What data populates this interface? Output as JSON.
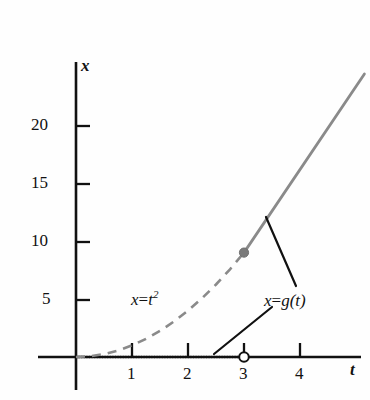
{
  "figure": {
    "title": "",
    "background_color": "#fefefe",
    "ink_color": "#111111",
    "curve_color": "#8a8a8a"
  },
  "axes": {
    "x_axis_name": "t",
    "y_axis_name": "x",
    "x_ticks": [
      "1",
      "2",
      "3",
      "4"
    ],
    "y_ticks": [
      "5",
      "10",
      "15",
      "20"
    ]
  },
  "labels": {
    "parabola": {
      "lhs": "x",
      "op": "=",
      "base": "t",
      "exponent": "2"
    },
    "piecewise": {
      "lhs": "x",
      "op": "=",
      "rhs": "g(t)"
    }
  },
  "markers": {
    "closed_point_label": "(3, 9)",
    "open_point_label": "(3, 0)"
  },
  "chart_data": {
    "type": "line",
    "title": "",
    "xlabel": "t",
    "ylabel": "x",
    "xlim": [
      -0.45,
      5.2
    ],
    "ylim": [
      -1.2,
      25.5
    ],
    "grid": false,
    "legend": "none",
    "x_ticks": [
      1,
      2,
      3,
      4
    ],
    "y_ticks": [
      5,
      10,
      15,
      20
    ],
    "series": [
      {
        "name": "x = t^2",
        "style": "dashed",
        "color": "#8a8a8a",
        "annotation": "x = t²",
        "x": [
          0,
          0.25,
          0.5,
          0.75,
          1,
          1.25,
          1.5,
          1.75,
          2,
          2.25,
          2.5,
          2.75,
          3
        ],
        "y": [
          0,
          0.0625,
          0.25,
          0.5625,
          1,
          1.5625,
          2.25,
          3.0625,
          4,
          5.0625,
          6.25,
          7.5625,
          9
        ]
      },
      {
        "name": "x = g(t)",
        "style": "solid",
        "color": "#8a8a8a",
        "annotation": "x = g(t)",
        "x": [
          3,
          3.5,
          4,
          4.5,
          5,
          5.15
        ],
        "y": [
          9,
          12.5,
          16,
          19.5,
          23,
          24.4
        ]
      },
      {
        "name": "g(t) on [0,3)",
        "style": "dotted-gray",
        "color": "#9a9a9a",
        "x": [
          0,
          0.5,
          1,
          1.5,
          2,
          2.5,
          3
        ],
        "y": [
          0,
          0,
          0,
          0,
          0,
          0,
          0
        ]
      }
    ],
    "points": [
      {
        "x": 3,
        "y": 9,
        "marker": "filled-circle",
        "color": "#7a7a7a"
      },
      {
        "x": 3,
        "y": 0,
        "marker": "open-circle",
        "color": "#111111"
      }
    ],
    "annotations": [
      {
        "text": "x = t²",
        "x": 1.15,
        "y": 5.2
      },
      {
        "text": "x = g(t)",
        "x": 3.4,
        "y": 5.6
      }
    ]
  }
}
